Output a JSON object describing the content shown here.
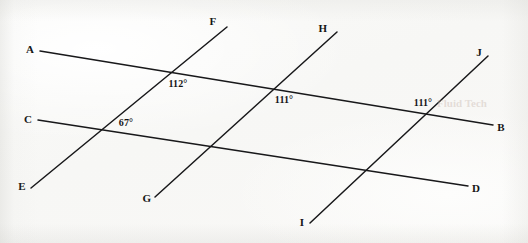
{
  "figure": {
    "kind": "geometry-diagram",
    "width": 528,
    "height": 243,
    "background_color": "#fbfbfa",
    "line_color": "#18181a",
    "label_color": "#141414"
  },
  "points": [
    {
      "id": "A",
      "label": "A",
      "x": 30,
      "y": 49
    },
    {
      "id": "F",
      "label": "F",
      "x": 213,
      "y": 21
    },
    {
      "id": "H",
      "label": "H",
      "x": 323,
      "y": 28
    },
    {
      "id": "J",
      "label": "J",
      "x": 479,
      "y": 52
    },
    {
      "id": "C",
      "label": "C",
      "x": 28,
      "y": 119
    },
    {
      "id": "B",
      "label": "B",
      "x": 501,
      "y": 127
    },
    {
      "id": "E",
      "label": "E",
      "x": 22,
      "y": 186
    },
    {
      "id": "G",
      "label": "G",
      "x": 147,
      "y": 198
    },
    {
      "id": "D",
      "label": "D",
      "x": 476,
      "y": 188
    },
    {
      "id": "I",
      "label": "I",
      "x": 302,
      "y": 222
    }
  ],
  "lines": [
    {
      "id": "AB",
      "from": "A",
      "to": "B",
      "x1": 40,
      "y1": 51,
      "x2": 493,
      "y2": 125,
      "role": "parallel-line-1",
      "stroke_width": 1.5
    },
    {
      "id": "CD",
      "from": "C",
      "to": "D",
      "x1": 38,
      "y1": 120,
      "x2": 468,
      "y2": 186,
      "role": "parallel-line-2",
      "stroke_width": 1.5
    },
    {
      "id": "EF",
      "from": "E",
      "to": "F",
      "x1": 31,
      "y1": 188,
      "x2": 227,
      "y2": 27,
      "role": "transversal-1",
      "stroke_width": 1.5
    },
    {
      "id": "GH",
      "from": "G",
      "to": "H",
      "x1": 155,
      "y1": 197,
      "x2": 337,
      "y2": 32,
      "role": "transversal-2",
      "stroke_width": 1.5
    },
    {
      "id": "IJ",
      "from": "I",
      "to": "J",
      "x1": 310,
      "y1": 223,
      "x2": 488,
      "y2": 56,
      "role": "transversal-3",
      "stroke_width": 1.5
    }
  ],
  "angles": [
    {
      "id": "angle-112",
      "value": "112°",
      "x": 178,
      "y": 84,
      "at_intersection": "AB × EF",
      "vertex_x": 163,
      "vertex_y": 76
    },
    {
      "id": "angle-67",
      "value": "67°",
      "x": 126,
      "y": 123,
      "at_intersection": "CD × EF",
      "vertex_x": 102,
      "vertex_y": 122
    },
    {
      "id": "angle-111-left",
      "value": "111°",
      "x": 284,
      "y": 100,
      "at_intersection": "AB × GH",
      "vertex_x": 262,
      "vertex_y": 92
    },
    {
      "id": "angle-111-right",
      "value": "111°",
      "x": 423,
      "y": 103,
      "at_intersection": "AB × IJ",
      "vertex_x": 443,
      "vertex_y": 110
    }
  ],
  "watermarks": [
    {
      "id": "wm-1",
      "text": "Fluid Tech",
      "x": 462,
      "y": 103
    }
  ]
}
